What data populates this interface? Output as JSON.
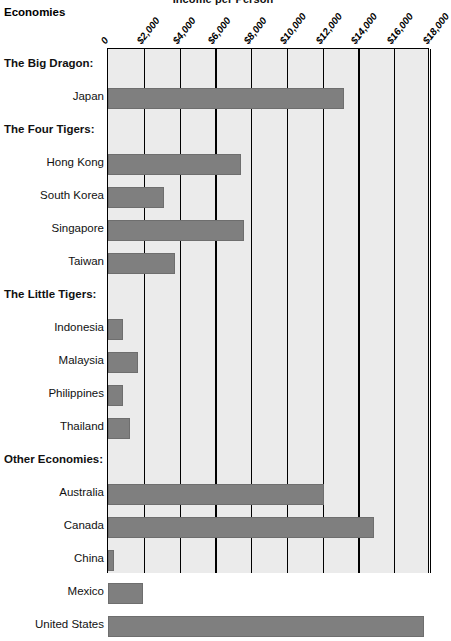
{
  "title": "Income per Person",
  "column_header": "Economies",
  "axis": {
    "ticks": [
      "0",
      "$2,000",
      "$4,000",
      "$6,000",
      "$8,000",
      "$10,000",
      "$12,000",
      "$14,000",
      "$16,000",
      "$18,000"
    ],
    "min": 0,
    "max": 18000,
    "step": 2000
  },
  "colors": {
    "bar_fill": "#7f7f7f",
    "plot_background": "#ebebeb",
    "axis_line": "#000000",
    "text": "#000000"
  },
  "rows": [
    {
      "label": "The Big Dragon:",
      "type": "group"
    },
    {
      "label": "Japan",
      "type": "item",
      "value": 13200
    },
    {
      "label": "The Four Tigers:",
      "type": "group"
    },
    {
      "label": "Hong Kong",
      "type": "item",
      "value": 7450
    },
    {
      "label": "South Korea",
      "type": "item",
      "value": 3150
    },
    {
      "label": "Singapore",
      "type": "item",
      "value": 7600
    },
    {
      "label": "Taiwan",
      "type": "item",
      "value": 3750
    },
    {
      "label": "The Little Tigers:",
      "type": "group"
    },
    {
      "label": "Indonesia",
      "type": "item",
      "value": 840
    },
    {
      "label": "Malaysia",
      "type": "item",
      "value": 1680
    },
    {
      "label": "Philippines",
      "type": "item",
      "value": 840
    },
    {
      "label": "Thailand",
      "type": "item",
      "value": 1230
    },
    {
      "label": "Other Economies:",
      "type": "group"
    },
    {
      "label": "Australia",
      "type": "item",
      "value": 12050
    },
    {
      "label": "Canada",
      "type": "item",
      "value": 14850
    },
    {
      "label": "China",
      "type": "item",
      "value": 340
    },
    {
      "label": "Mexico",
      "type": "item",
      "value": 1960
    },
    {
      "label": "United States",
      "type": "item",
      "value": 17650
    }
  ],
  "chart_data": {
    "type": "bar",
    "orientation": "horizontal",
    "title": "Income per Person",
    "xlabel": "",
    "ylabel": "Economies",
    "xlim": [
      0,
      18000
    ],
    "xticks": [
      0,
      2000,
      4000,
      6000,
      8000,
      10000,
      12000,
      14000,
      16000,
      18000
    ],
    "xtick_labels": [
      "0",
      "$2,000",
      "$4,000",
      "$6,000",
      "$8,000",
      "$10,000",
      "$12,000",
      "$14,000",
      "$16,000",
      "$18,000"
    ],
    "grid": true,
    "legend": false,
    "group_headers": [
      "The Big Dragon:",
      "The Four Tigers:",
      "The Little Tigers:",
      "Other Economies:"
    ],
    "categories": [
      "Japan",
      "Hong Kong",
      "South Korea",
      "Singapore",
      "Taiwan",
      "Indonesia",
      "Malaysia",
      "Philippines",
      "Thailand",
      "Australia",
      "Canada",
      "China",
      "Mexico",
      "United States"
    ],
    "values": [
      13200,
      7450,
      3150,
      7600,
      3750,
      840,
      1680,
      840,
      1230,
      12050,
      14850,
      340,
      1960,
      17650
    ],
    "groups": {
      "The Big Dragon:": [
        "Japan"
      ],
      "The Four Tigers:": [
        "Hong Kong",
        "South Korea",
        "Singapore",
        "Taiwan"
      ],
      "The Little Tigers:": [
        "Indonesia",
        "Malaysia",
        "Philippines",
        "Thailand"
      ],
      "Other Economies:": [
        "Australia",
        "Canada",
        "China",
        "Mexico",
        "United States"
      ]
    }
  }
}
